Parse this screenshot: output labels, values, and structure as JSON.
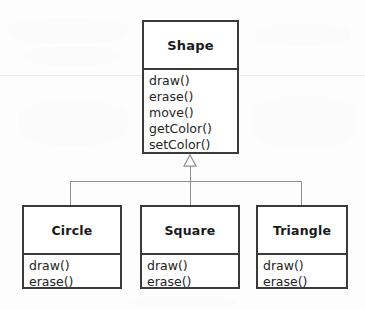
{
  "diagram": {
    "type": "uml-class-diagram",
    "relationship": "generalization",
    "colors": {
      "background": "#fdfdfd",
      "box_fill": "#ffffff",
      "box_border": "#3a3a3a",
      "text": "#1a1a1a",
      "connector": "#8e8e8e"
    },
    "superclass": {
      "name": "Shape",
      "operations": [
        "draw()",
        "erase()",
        "move()",
        "getColor()",
        "setColor()"
      ]
    },
    "subclasses": [
      {
        "name": "Circle",
        "operations": [
          "draw()",
          "erase()"
        ]
      },
      {
        "name": "Square",
        "operations": [
          "draw()",
          "erase()"
        ]
      },
      {
        "name": "Triangle",
        "operations": [
          "draw()",
          "erase()"
        ]
      }
    ]
  }
}
